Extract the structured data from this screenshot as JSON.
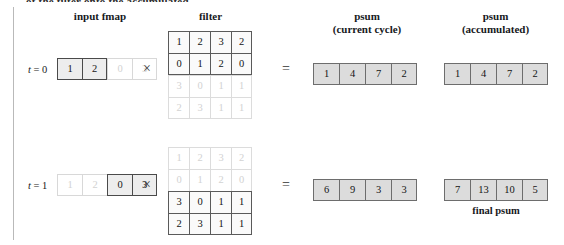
{
  "figure": {
    "clipped_top_text": "of the filter onto the accumulated",
    "headers": {
      "input_fmap": "input fmap",
      "filter": "filter",
      "psum_current_line1": "psum",
      "psum_current_line2": "(current cycle)",
      "psum_accum_line1": "psum",
      "psum_accum_line2": "(accumulated)"
    },
    "operators": {
      "multiply": "×",
      "equals": "="
    },
    "final_caption": "final psum"
  },
  "rows": [
    {
      "time_label_prefix": "t",
      "time_label_eq": "= 0",
      "input_fmap": {
        "values": [
          "1",
          "2",
          "0",
          "3"
        ],
        "active": [
          true,
          true,
          false,
          false
        ]
      },
      "filter": {
        "values": [
          [
            "1",
            "2",
            "3",
            "2"
          ],
          [
            "0",
            "1",
            "2",
            "0"
          ],
          [
            "3",
            "0",
            "1",
            "1"
          ],
          [
            "2",
            "3",
            "1",
            "1"
          ]
        ],
        "active_rows": [
          true,
          true,
          false,
          false
        ]
      },
      "psum_current": {
        "values": [
          "1",
          "4",
          "7",
          "2"
        ]
      },
      "psum_accumulated": {
        "values": [
          "1",
          "4",
          "7",
          "2"
        ]
      }
    },
    {
      "time_label_prefix": "t",
      "time_label_eq": "= 1",
      "input_fmap": {
        "values": [
          "1",
          "2",
          "0",
          "3"
        ],
        "active": [
          false,
          false,
          true,
          true
        ]
      },
      "filter": {
        "values": [
          [
            "1",
            "2",
            "3",
            "2"
          ],
          [
            "0",
            "1",
            "2",
            "0"
          ],
          [
            "3",
            "0",
            "1",
            "1"
          ],
          [
            "2",
            "3",
            "1",
            "1"
          ]
        ],
        "active_rows": [
          false,
          false,
          true,
          true
        ]
      },
      "psum_current": {
        "values": [
          "6",
          "9",
          "3",
          "3"
        ]
      },
      "psum_accumulated": {
        "values": [
          "7",
          "13",
          "10",
          "5"
        ]
      }
    }
  ],
  "colors": {
    "active_border": "#4a4a4a",
    "inactive_text": "#d2d2d2",
    "psum_fill": "#dcdcdc",
    "fmap_active_fill": "#ededed",
    "rule": "#b9b9b9"
  }
}
